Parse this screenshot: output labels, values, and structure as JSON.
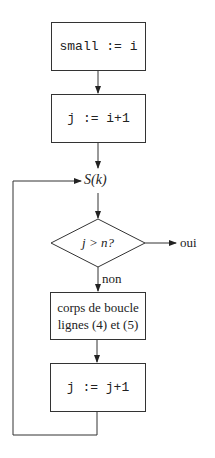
{
  "diagram": {
    "type": "flowchart",
    "nodes": {
      "init_small": {
        "shape": "rectangle",
        "text": "small := i"
      },
      "init_j": {
        "shape": "rectangle",
        "text": "j := i+1"
      },
      "invariant": {
        "shape": "label",
        "text": "S(k)"
      },
      "condition": {
        "shape": "diamond",
        "text": "j > n?"
      },
      "loop_body_line1": "corps de boucle",
      "loop_body_line2": "lignes (4) et (5)",
      "increment": {
        "shape": "rectangle",
        "text": "j := j+1"
      }
    },
    "edges": {
      "yes_label": "oui",
      "no_label": "non"
    },
    "colors": {
      "stroke": "#333333",
      "text": "#222222",
      "background": "#ffffff"
    }
  }
}
